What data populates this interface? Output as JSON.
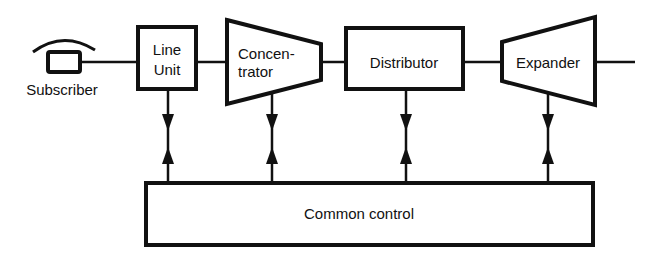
{
  "diagram": {
    "blocks": [
      {
        "id": "subscriber",
        "label": "Subscriber"
      },
      {
        "id": "line-unit",
        "label_line1": "Line",
        "label_line2": "Unit"
      },
      {
        "id": "concentrator",
        "label_line1": "Concen-",
        "label_line2": "trator"
      },
      {
        "id": "distributor",
        "label": "Distributor"
      },
      {
        "id": "expander",
        "label": "Expander"
      },
      {
        "id": "common-control",
        "label": "Common control"
      }
    ],
    "colors": {
      "stroke": "#111111",
      "background": "#ffffff"
    }
  }
}
